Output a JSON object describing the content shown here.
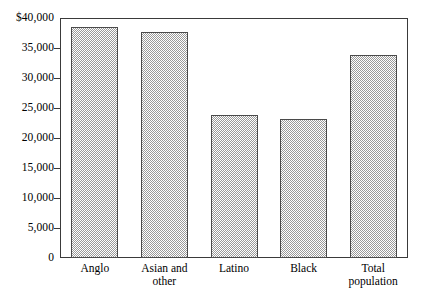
{
  "chart_data": {
    "type": "bar",
    "title": "",
    "subtitle": "",
    "xlabel": "",
    "ylabel": "",
    "categories": [
      "Anglo",
      "Asian and\nother",
      "Latino",
      "Black",
      "Total\npopulation"
    ],
    "values": [
      38500,
      37700,
      23800,
      23200,
      33900
    ],
    "ylim": [
      0,
      40000
    ],
    "yticks": [
      0,
      5000,
      10000,
      15000,
      20000,
      25000,
      30000,
      35000,
      40000
    ],
    "ytick_labels": [
      "0",
      "5,000",
      "10,000",
      "15,000",
      "20,000",
      "25,000",
      "30,000",
      "35,000",
      "$40,000"
    ],
    "grid": false,
    "legend": null,
    "bar_fill": "#9a9a9a",
    "bar_edge": "#4a4a4a",
    "frame_color": "#3a3a3a",
    "background": "#ffffff"
  },
  "axis": {
    "y_ticks": [
      {
        "label": "$40,000",
        "value": 40000
      },
      {
        "label": "35,000",
        "value": 35000
      },
      {
        "label": "30,000",
        "value": 30000
      },
      {
        "label": "25,000",
        "value": 25000
      },
      {
        "label": "20,000",
        "value": 20000
      },
      {
        "label": "15,000",
        "value": 15000
      },
      {
        "label": "10,000",
        "value": 10000
      },
      {
        "label": "5,000",
        "value": 5000
      },
      {
        "label": "0",
        "value": 0
      }
    ],
    "x_categories": [
      {
        "label": "Anglo"
      },
      {
        "label": "Asian and\nother"
      },
      {
        "label": "Latino"
      },
      {
        "label": "Black"
      },
      {
        "label": "Total\npopulation"
      }
    ]
  }
}
